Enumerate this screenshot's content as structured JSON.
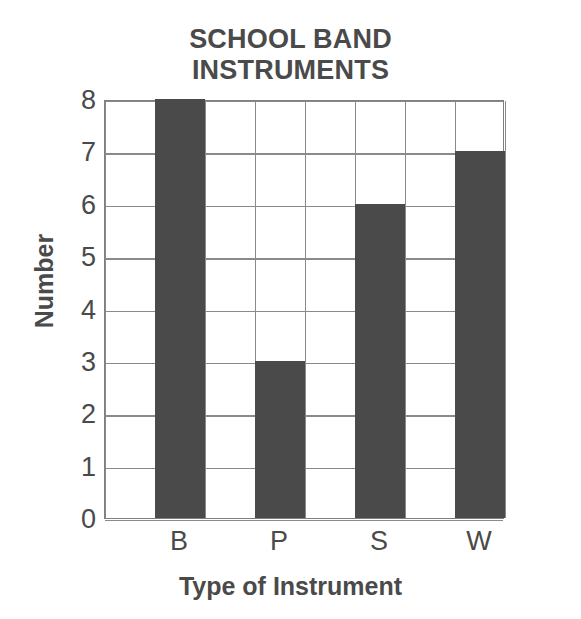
{
  "chart_data": {
    "type": "bar",
    "title": "SCHOOL BAND INSTRUMENTS",
    "title_lines": [
      "SCHOOL BAND",
      "INSTRUMENTS"
    ],
    "categories": [
      "B",
      "P",
      "S",
      "W"
    ],
    "values": [
      8,
      3,
      6,
      7
    ],
    "xlabel": "Type of Instrument",
    "ylabel": "Number",
    "ylim": [
      0,
      8
    ],
    "ytick_labels": [
      "8",
      "7",
      "6",
      "5",
      "4",
      "3",
      "2",
      "1",
      "0"
    ],
    "ytick_values": [
      8,
      7,
      6,
      5,
      4,
      3,
      2,
      1,
      0
    ],
    "grid": true,
    "grid_columns": 8,
    "grid_rows": 8,
    "legend": null,
    "bar_color": "#4a4a4a",
    "grid_color": "#8a8a8a",
    "axis_color": "#7f7f7f",
    "text_color": "#4a4a4a",
    "background": "#ffffff"
  }
}
